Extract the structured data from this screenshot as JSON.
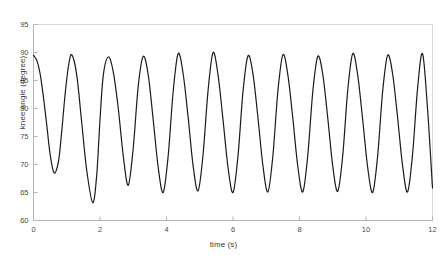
{
  "chart_data": {
    "type": "line",
    "title": "",
    "subtitle": "",
    "xlabel": "time (s)",
    "ylabel": "knee angle (degree)",
    "xlim": [
      0,
      12
    ],
    "ylim": [
      60,
      95
    ],
    "xticks": [
      0,
      2,
      4,
      6,
      8,
      10,
      12
    ],
    "xtick_labels": [
      "0",
      "2",
      "4",
      "6",
      "8",
      "10",
      "12"
    ],
    "yticks": [
      60,
      65,
      70,
      75,
      80,
      85,
      90,
      95
    ],
    "ytick_labels": [
      "60",
      "65",
      "70",
      "75",
      "80",
      "85",
      "90",
      "95"
    ],
    "grid": false,
    "legend": null,
    "series": [
      {
        "name": "knee angle",
        "color": "#1a1a1a",
        "line_width": 1.2,
        "peaks_t": [
          0.0,
          1.15,
          2.25,
          3.3,
          4.35,
          5.4,
          6.45,
          7.5,
          8.55,
          9.6,
          10.65,
          11.7
        ],
        "peaks_y": [
          89.5,
          89.6,
          89.2,
          89.3,
          89.8,
          90.0,
          89.4,
          89.6,
          89.3,
          89.8,
          89.5,
          89.8
        ],
        "valleys_t": [
          0.62,
          1.78,
          2.85,
          3.9,
          4.95,
          6.0,
          7.05,
          8.1,
          9.15,
          10.2,
          11.25
        ],
        "valleys_y": [
          68.5,
          63.2,
          66.3,
          65.0,
          65.3,
          65.0,
          65.1,
          65.1,
          65.2,
          65.0,
          65.1
        ],
        "x": [
          0.0,
          0.1,
          0.2,
          0.3,
          0.4,
          0.5,
          0.62,
          0.75,
          0.85,
          0.95,
          1.05,
          1.15,
          1.3,
          1.45,
          1.6,
          1.78,
          1.9,
          2.0,
          2.1,
          2.25,
          2.4,
          2.55,
          2.7,
          2.85,
          3.0,
          3.15,
          3.3,
          3.45,
          3.6,
          3.75,
          3.9,
          4.05,
          4.2,
          4.35,
          4.5,
          4.65,
          4.8,
          4.95,
          5.1,
          5.25,
          5.4,
          5.55,
          5.7,
          5.85,
          6.0,
          6.15,
          6.3,
          6.45,
          6.6,
          6.75,
          6.9,
          7.05,
          7.2,
          7.35,
          7.5,
          7.65,
          7.8,
          7.95,
          8.1,
          8.25,
          8.4,
          8.55,
          8.7,
          8.85,
          9.0,
          9.15,
          9.3,
          9.45,
          9.6,
          9.75,
          9.9,
          10.05,
          10.2,
          10.35,
          10.5,
          10.65,
          10.8,
          10.95,
          11.1,
          11.25,
          11.4,
          11.55,
          11.7,
          11.85,
          12.0
        ],
        "y": [
          89.5,
          88.6,
          86.2,
          82.0,
          77.0,
          71.8,
          68.5,
          70.5,
          76.0,
          82.5,
          87.5,
          89.6,
          86.0,
          77.5,
          69.0,
          63.2,
          68.0,
          78.0,
          86.0,
          89.2,
          86.5,
          80.0,
          71.5,
          66.3,
          73.0,
          84.0,
          89.3,
          86.0,
          78.0,
          69.5,
          65.0,
          71.5,
          83.0,
          89.8,
          86.2,
          78.5,
          69.8,
          65.3,
          71.8,
          83.2,
          90.0,
          86.0,
          78.0,
          69.5,
          65.0,
          71.5,
          83.0,
          89.4,
          86.2,
          78.4,
          69.8,
          65.1,
          71.6,
          83.1,
          89.6,
          86.0,
          78.2,
          69.6,
          65.1,
          71.7,
          83.0,
          89.3,
          86.1,
          78.3,
          69.7,
          65.2,
          71.6,
          83.2,
          89.8,
          86.0,
          78.0,
          69.5,
          65.0,
          71.5,
          83.0,
          89.5,
          86.2,
          78.4,
          69.8,
          65.1,
          71.8,
          83.5,
          89.8,
          80.0,
          65.8
        ]
      }
    ]
  },
  "axes": {
    "x_axis_label": "time (s)",
    "y_axis_label": "knee angle (degree)"
  }
}
